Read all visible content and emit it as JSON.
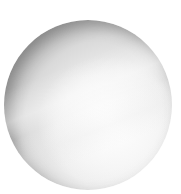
{
  "image": {
    "subject": "grayscale sphere",
    "background_color": "#ffffff",
    "sphere": {
      "center": [
        88,
        105
      ],
      "radius": 84,
      "highlight_color": "#fafafa",
      "shadow_color": "#7a7a7a"
    }
  }
}
